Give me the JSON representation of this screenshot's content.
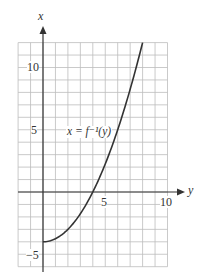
{
  "chart_data": {
    "type": "line",
    "title": "",
    "xlabel": "y",
    "ylabel": "x",
    "xlim": [
      -2,
      10
    ],
    "ylim": [
      -6,
      12
    ],
    "grid": true,
    "x_ticks": [
      {
        "value": 5,
        "label": "5"
      },
      {
        "value": 10,
        "label": "10"
      }
    ],
    "y_ticks": [
      {
        "value": 10,
        "label": "10"
      },
      {
        "value": 5,
        "label": "5"
      },
      {
        "value": -5,
        "label": "−5"
      }
    ],
    "series": [
      {
        "name": "x = f⁻¹(y)",
        "x": [
          0,
          1,
          2,
          3,
          4,
          5,
          6,
          7,
          8
        ],
        "y": [
          -4,
          -3.75,
          -3,
          -1.75,
          0,
          2.25,
          5,
          8.25,
          12
        ]
      }
    ],
    "annotations": [
      {
        "text": "x = f⁻¹(y)",
        "at": [
          3.2,
          4
        ]
      }
    ]
  },
  "labels": {
    "x_axis_name": "y",
    "y_axis_name": "x",
    "tick_x_5": "5",
    "tick_x_10": "10",
    "tick_y_10": "10",
    "tick_y_5": "5",
    "tick_y_neg5": "−5",
    "curve_label": "x = f⁻¹(y)"
  },
  "colors": {
    "grid": "#b8b8b8",
    "axis": "#333333",
    "curve": "#333333"
  }
}
